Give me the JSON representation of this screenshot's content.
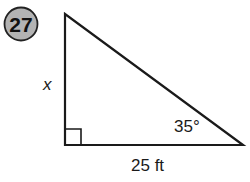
{
  "problem": {
    "number": "27",
    "badge_fill": "#b3b3b3"
  },
  "triangle": {
    "vertices": {
      "top": [
        65,
        14
      ],
      "right_angle": [
        65,
        145
      ],
      "bottom_right": [
        243,
        145
      ]
    },
    "side_label_vertical": "x",
    "side_label_base": "25 ft",
    "angle_label": "35°",
    "right_angle_marker": true
  }
}
